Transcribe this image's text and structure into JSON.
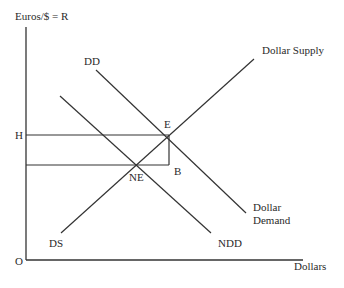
{
  "diagram": {
    "axes": {
      "y_label": "Euros/$ = R",
      "x_label": "Dollars",
      "origin_label": "O"
    },
    "price_labels": {
      "h": "H"
    },
    "curves": {
      "dd": {
        "label": "DD",
        "end_label_line1": "Dollar",
        "end_label_line2": "Demand"
      },
      "ndd": {
        "label": "NDD"
      },
      "supply": {
        "start_label": "DS",
        "end_label": "Dollar Supply"
      }
    },
    "points": {
      "e": "E",
      "ne": "NE",
      "b": "B"
    },
    "colors": {
      "line": "#333333",
      "text": "#2a2a2a",
      "background": "#ffffff"
    }
  }
}
